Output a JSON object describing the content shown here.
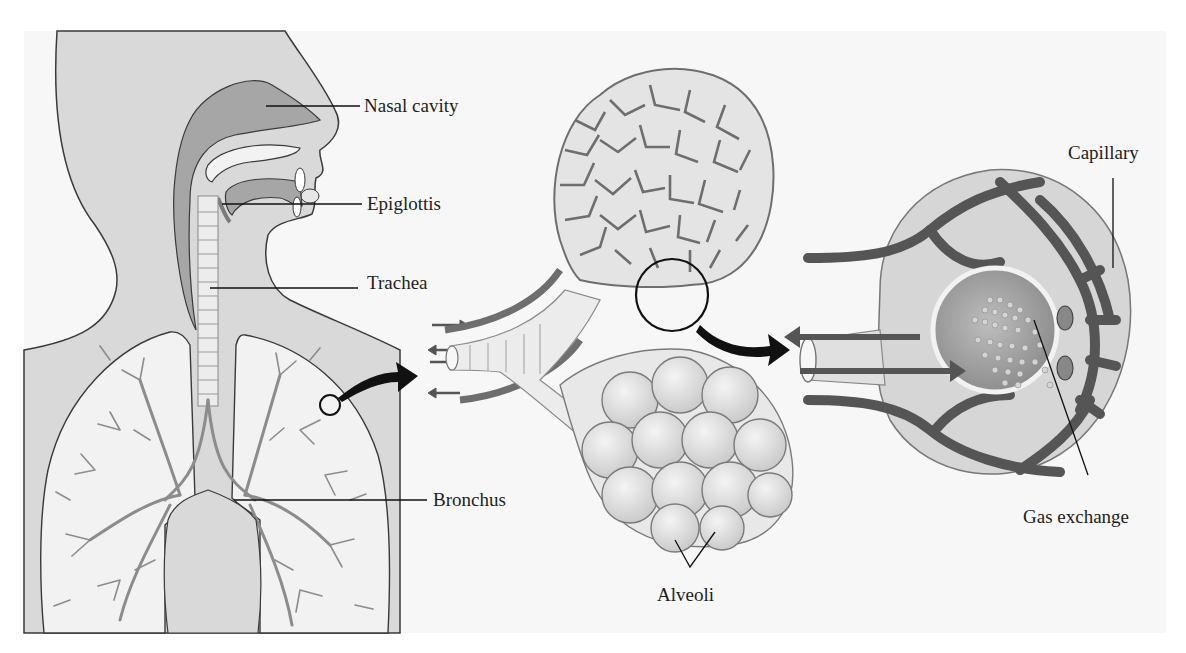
{
  "figure": {
    "panels": [
      {
        "id": "body",
        "title": "Respiratory tract and lungs"
      },
      {
        "id": "alveolar-sac",
        "title": "Bronchiole and alveolar sacs"
      },
      {
        "id": "alveolus",
        "title": "Alveolus with capillaries"
      }
    ],
    "labels": {
      "nasal_cavity": "Nasal cavity",
      "epiglottis": "Epiglottis",
      "trachea": "Trachea",
      "bronchus": "Bronchus",
      "alveoli": "Alveoli",
      "capillary": "Capillary",
      "gas_exchange": "Gas exchange"
    },
    "colors": {
      "background": "#ffffff",
      "panel": "#f7f7f7",
      "body_fill": "#d9d9d9",
      "cavity_fill": "#a6a6a6",
      "lung_fill": "#f2f2f2",
      "tissue_fill": "#e0e0e0",
      "vessel_fill": "#6e6e6e",
      "outline": "#3a3a3a",
      "leader_line": "#111111",
      "text": "#1e1e1e"
    }
  }
}
